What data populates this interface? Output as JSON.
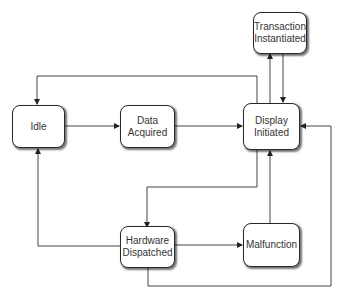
{
  "diagram": {
    "type": "state-transition",
    "nodes": {
      "transaction_instantiated": {
        "label": "Transaction\nInstantiated"
      },
      "idle": {
        "label": "Idle"
      },
      "data_acquired": {
        "label": "Data\nAcquired"
      },
      "display_initiated": {
        "label": "Display\nInitiated"
      },
      "hardware_dispatched": {
        "label": "Hardware\nDispatched"
      },
      "malfunction": {
        "label": "Malfunction"
      }
    },
    "edges": [
      {
        "from": "Idle",
        "to": "Data Acquired"
      },
      {
        "from": "Data Acquired",
        "to": "Display Initiated"
      },
      {
        "from": "Display Initiated",
        "to": "Transaction Instantiated"
      },
      {
        "from": "Transaction Instantiated",
        "to": "Display Initiated"
      },
      {
        "from": "Display Initiated",
        "to": "Idle"
      },
      {
        "from": "Display Initiated",
        "to": "Hardware Dispatched"
      },
      {
        "from": "Hardware Dispatched",
        "to": "Idle"
      },
      {
        "from": "Hardware Dispatched",
        "to": "Malfunction"
      },
      {
        "from": "Malfunction",
        "to": "Display Initiated"
      },
      {
        "from": "Hardware Dispatched",
        "to": "Display Initiated"
      }
    ],
    "colors": {
      "line": "#333333",
      "box_border": "#2a2a2a",
      "text": "#333333",
      "background": "#ffffff"
    }
  }
}
